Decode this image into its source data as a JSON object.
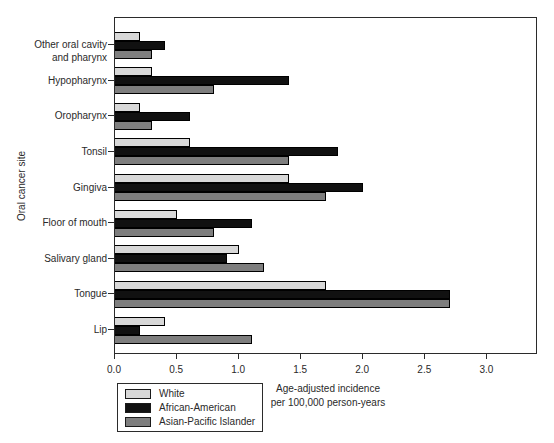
{
  "chart_data": {
    "type": "bar",
    "orientation": "horizontal",
    "ylabel": "Oral cancer site",
    "xlabel": "Age-adjusted incidence per 100,000 person-years",
    "xlabel_lines": [
      "Age-adjusted incidence",
      "per 100,000 person-years"
    ],
    "xlim": [
      0,
      3.4
    ],
    "xticks": [
      0,
      0.5,
      1,
      1.5,
      2,
      2.5,
      3
    ],
    "grid": false,
    "legend_position": "bottom-left",
    "bar_outline_color": "#000000",
    "categories": [
      "Other oral cavity and pharynx",
      "Hypopharynx",
      "Oropharynx",
      "Tonsil",
      "Gingiva",
      "Floor of mouth",
      "Salivary gland",
      "Tongue",
      "Lip"
    ],
    "series": [
      {
        "name": "White",
        "color": "#d8d8d8",
        "values": [
          0.2,
          0.3,
          0.2,
          0.6,
          1.4,
          0.5,
          1.0,
          1.7,
          0.4
        ]
      },
      {
        "name": "African-American",
        "color": "#111111",
        "values": [
          0.4,
          1.4,
          0.6,
          1.8,
          2.0,
          1.1,
          0.9,
          2.7,
          0.2
        ]
      },
      {
        "name": "Asian-Pacific Islander",
        "color": "#7e7e7e",
        "values": [
          0.3,
          0.8,
          0.3,
          1.4,
          1.7,
          0.8,
          1.2,
          2.7,
          1.1
        ]
      }
    ]
  }
}
